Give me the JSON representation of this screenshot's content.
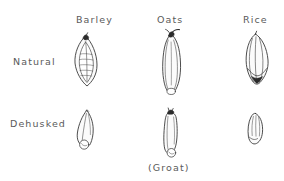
{
  "figure": {
    "background_color": "#ffffff",
    "ink_color": "#3a3a3a",
    "text_color": "#5a5a5a",
    "fill_color": "#fbfbfb"
  },
  "columns": [
    {
      "id": "barley",
      "label": "Barley"
    },
    {
      "id": "oats",
      "label": "Oats"
    },
    {
      "id": "rice",
      "label": "Rice"
    }
  ],
  "rows": [
    {
      "id": "natural",
      "label": "Natural"
    },
    {
      "id": "dehusked",
      "label": "Dehusked"
    }
  ],
  "caption": {
    "groat": "(Groat)"
  },
  "specimens": [
    {
      "id": "barley-natural",
      "name": "barley-natural-grain",
      "column": "Barley",
      "row": "Natural",
      "shape": "pointed-oval-lens-with-veins",
      "has_dark_tip": true
    },
    {
      "id": "oats-natural",
      "name": "oats-natural-grain",
      "column": "Oats",
      "row": "Natural",
      "shape": "elongated-capsule-with-awn",
      "has_dark_tip": true
    },
    {
      "id": "rice-natural",
      "name": "rice-natural-grain",
      "column": "Rice",
      "row": "Natural",
      "shape": "ribbed-pointed-oval",
      "has_dark_tip": true
    },
    {
      "id": "barley-dehusked",
      "name": "barley-dehusked-grain",
      "column": "Barley",
      "row": "Dehusked",
      "shape": "teardrop-flame-with-embryo",
      "has_dark_tip": false
    },
    {
      "id": "oats-dehusked",
      "name": "oats-dehusked-groat",
      "column": "Oats",
      "row": "Dehusked",
      "shape": "narrow-capsule-with-embryo",
      "has_dark_tip": true
    },
    {
      "id": "rice-dehusked",
      "name": "rice-dehusked-grain",
      "column": "Rice",
      "row": "Dehusked",
      "shape": "small-rounded-oval",
      "has_dark_tip": false
    }
  ]
}
